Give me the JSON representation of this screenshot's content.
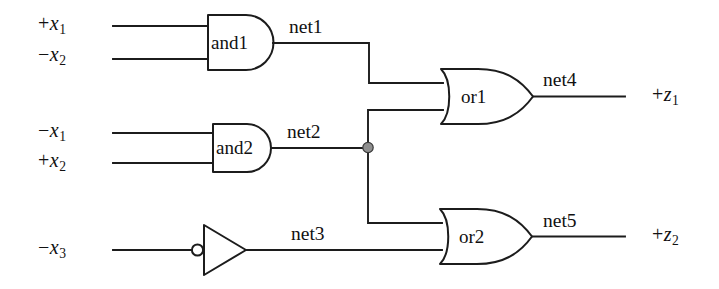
{
  "diagram": {
    "background_color": "#ffffff",
    "line_color": "#1c1c1c",
    "junction_color": "#8f8f8f"
  },
  "inputs": [
    {
      "id": "in-x1-pos",
      "sign": "+",
      "var": "x",
      "subscript": "1",
      "text": "+x1",
      "target_gate": "and1"
    },
    {
      "id": "in-x2-neg",
      "sign": "−",
      "var": "x",
      "subscript": "2",
      "text": "−x2",
      "target_gate": "and1"
    },
    {
      "id": "in-x1-neg",
      "sign": "−",
      "var": "x",
      "subscript": "1",
      "text": "−x1",
      "target_gate": "and2"
    },
    {
      "id": "in-x2-pos",
      "sign": "+",
      "var": "x",
      "subscript": "2",
      "text": "+x2",
      "target_gate": "and2"
    },
    {
      "id": "in-x3-neg",
      "sign": "−",
      "var": "x",
      "subscript": "3",
      "text": "−x3",
      "target_gate": "inv1"
    }
  ],
  "outputs": [
    {
      "id": "out-z1",
      "sign": "+",
      "var": "z",
      "subscript": "1",
      "text": "+z1",
      "source_net": "net4"
    },
    {
      "id": "out-z2",
      "sign": "+",
      "var": "z",
      "subscript": "2",
      "text": "+z2",
      "source_net": "net5"
    }
  ],
  "gates": [
    {
      "id": "and1",
      "label": "and1",
      "type": "and",
      "inputs": [
        "+x1",
        "−x2"
      ],
      "output": "net1"
    },
    {
      "id": "and2",
      "label": "and2",
      "type": "and",
      "inputs": [
        "−x1",
        "+x2"
      ],
      "output": "net2"
    },
    {
      "id": "inv1",
      "label": "",
      "type": "inverter",
      "inputs": [
        "−x3"
      ],
      "output": "net3"
    },
    {
      "id": "or1",
      "label": "or1",
      "type": "or",
      "inputs": [
        "net1",
        "net2"
      ],
      "output": "net4"
    },
    {
      "id": "or2",
      "label": "or2",
      "type": "or",
      "inputs": [
        "net2",
        "net3"
      ],
      "output": "net5"
    }
  ],
  "nets": [
    {
      "id": "net1",
      "label": "net1",
      "from": "and1",
      "to": [
        "or1"
      ]
    },
    {
      "id": "net2",
      "label": "net2",
      "from": "and2",
      "to": [
        "or1",
        "or2"
      ],
      "has_junction": true
    },
    {
      "id": "net3",
      "label": "net3",
      "from": "inv1",
      "to": [
        "or2"
      ]
    },
    {
      "id": "net4",
      "label": "net4",
      "from": "or1",
      "to": [
        "+z1"
      ]
    },
    {
      "id": "net5",
      "label": "net5",
      "from": "or2",
      "to": [
        "+z2"
      ]
    }
  ]
}
